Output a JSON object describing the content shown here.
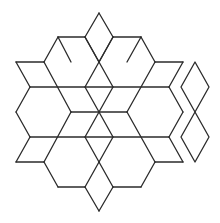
{
  "diagram": {
    "type": "geometric-tiling",
    "stroke_color": "#2b2b2b",
    "background": "#ffffff",
    "center": [
      99,
      112
    ],
    "main_figure_segments": [
      [
        99,
        13,
        85,
        37
      ],
      [
        99,
        13,
        113,
        37
      ],
      [
        85,
        37,
        99,
        62
      ],
      [
        113,
        37,
        99,
        62
      ],
      [
        58,
        37,
        85,
        37
      ],
      [
        113,
        37,
        141,
        37
      ],
      [
        58,
        37,
        44,
        62
      ],
      [
        141,
        37,
        155,
        62
      ],
      [
        16,
        62,
        44,
        62
      ],
      [
        155,
        62,
        183,
        62
      ],
      [
        16,
        62,
        30,
        87
      ],
      [
        183,
        62,
        169,
        87
      ],
      [
        44,
        62,
        71,
        112
      ],
      [
        155,
        62,
        127,
        112
      ],
      [
        85,
        37,
        113,
        87
      ],
      [
        113,
        37,
        85,
        87
      ],
      [
        30,
        87,
        169,
        87
      ],
      [
        30,
        87,
        16,
        112
      ],
      [
        169,
        87,
        183,
        112
      ],
      [
        16,
        112,
        30,
        137
      ],
      [
        183,
        112,
        169,
        137
      ],
      [
        71,
        112,
        127,
        112
      ],
      [
        85,
        87,
        113,
        137
      ],
      [
        113,
        87,
        85,
        137
      ],
      [
        30,
        137,
        169,
        137
      ],
      [
        30,
        137,
        16,
        162
      ],
      [
        169,
        137,
        183,
        162
      ],
      [
        16,
        162,
        44,
        162
      ],
      [
        155,
        162,
        183,
        162
      ],
      [
        44,
        162,
        71,
        112
      ],
      [
        155,
        162,
        127,
        112
      ],
      [
        44,
        162,
        58,
        187
      ],
      [
        155,
        162,
        141,
        187
      ],
      [
        58,
        187,
        85,
        187
      ],
      [
        113,
        187,
        141,
        187
      ],
      [
        99,
        162,
        85,
        187
      ],
      [
        99,
        162,
        113,
        187
      ],
      [
        85,
        187,
        99,
        211
      ],
      [
        113,
        187,
        99,
        211
      ],
      [
        85,
        137,
        99,
        162
      ],
      [
        113,
        137,
        99,
        162
      ],
      [
        58,
        37,
        71,
        62
      ],
      [
        141,
        37,
        127,
        62
      ]
    ],
    "separate_rhombi": [
      {
        "name": "upper",
        "points": [
          [
            195,
            62
          ],
          [
            209,
            87
          ],
          [
            195,
            112
          ],
          [
            181,
            87
          ]
        ]
      },
      {
        "name": "lower",
        "points": [
          [
            195,
            112
          ],
          [
            209,
            137
          ],
          [
            195,
            162
          ],
          [
            181,
            137
          ]
        ]
      }
    ]
  }
}
